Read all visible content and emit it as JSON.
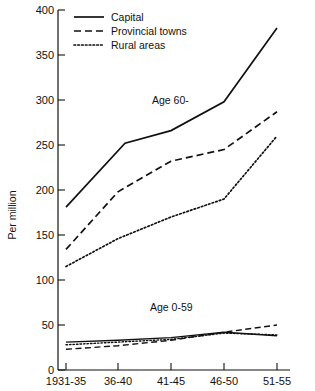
{
  "chart_data": {
    "type": "line",
    "title": "",
    "xlabel": "",
    "ylabel": "Per million",
    "categories": [
      "1931-35",
      "36-40",
      "41-45",
      "46-50",
      "51-55"
    ],
    "ylim": [
      0,
      400
    ],
    "yticks": [
      0,
      50,
      100,
      150,
      200,
      250,
      300,
      350,
      400
    ],
    "grid": false,
    "legend_position": "top-left",
    "groups": [
      {
        "annotation": "Age 60-",
        "series": [
          {
            "name": "Capital",
            "style": "solid",
            "values": [
              181,
              252,
              266,
              298,
              380
            ]
          },
          {
            "name": "Provincial towns",
            "style": "dashed",
            "values": [
              134,
              198,
              232,
              245,
              287
            ]
          },
          {
            "name": "Rural areas",
            "style": "dotted",
            "values": [
              115,
              146,
              170,
              190,
              260
            ]
          }
        ]
      },
      {
        "annotation": "Age 0-59",
        "series": [
          {
            "name": "Capital",
            "style": "solid",
            "values": [
              31,
              33,
              36,
              42,
              38
            ]
          },
          {
            "name": "Provincial towns",
            "style": "dashed",
            "values": [
              23,
              27,
              33,
              42,
              50
            ]
          },
          {
            "name": "Rural areas",
            "style": "dotted",
            "values": [
              28,
              31,
              34,
              41,
              39
            ]
          }
        ]
      }
    ]
  },
  "axis": {
    "y_title": "Per million",
    "y_ticks": [
      "400",
      "350",
      "300",
      "250",
      "200",
      "150",
      "100",
      "50",
      "0"
    ],
    "x_ticks": [
      "1931-35",
      "36-40",
      "41-45",
      "46-50",
      "51-55"
    ]
  },
  "legend": {
    "items": [
      {
        "label": "Capital"
      },
      {
        "label": "Provincial towns"
      },
      {
        "label": "Rural areas"
      }
    ]
  },
  "annotations": {
    "upper": "Age 60-",
    "lower": "Age 0-59"
  }
}
